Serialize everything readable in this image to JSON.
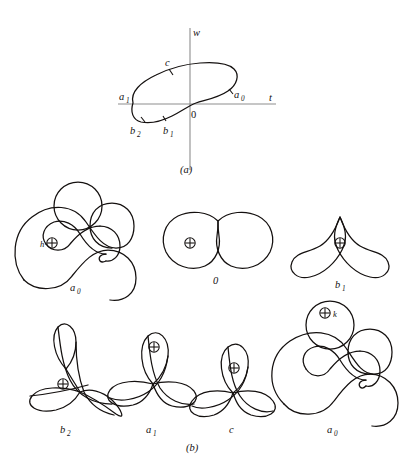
{
  "figure": {
    "background_color": "#ffffff",
    "stroke_color": "#14100f",
    "axis_color": "#8d8d8d",
    "panels": [
      {
        "id": "a",
        "caption": "(a)",
        "type": "closed-curve-in-tw-plane",
        "axes": {
          "horizontal_label": "t",
          "vertical_label": "w",
          "origin_label": "0"
        },
        "marked_points": [
          {
            "label": "a",
            "sub": "1",
            "position": "left-extreme-on-t-axis"
          },
          {
            "label": "b",
            "sub": "2",
            "position": "lower-left"
          },
          {
            "label": "b",
            "sub": "1",
            "position": "lower-middle"
          },
          {
            "label": "c",
            "sub": "",
            "position": "upper-left"
          },
          {
            "label": "a",
            "sub": "0",
            "position": "right-extreme"
          }
        ]
      },
      {
        "id": "b",
        "caption": "(b)",
        "type": "normal-forms-row",
        "figures": [
          {
            "label": "a",
            "sub": "0",
            "shape": "nested-band-with-circle",
            "index_marker": "circled-plus",
            "marker_label": "h",
            "row": 1,
            "col": 1
          },
          {
            "label": "0",
            "sub": "",
            "shape": "bilobed-cusp",
            "index_marker": "circled-plus",
            "marker_label": "",
            "row": 1,
            "col": 2
          },
          {
            "label": "b",
            "sub": "1",
            "shape": "spike-with-two-loops",
            "index_marker": "circled-plus",
            "marker_label": "",
            "row": 1,
            "col": 3
          },
          {
            "label": "b",
            "sub": "2",
            "shape": "trefoil-asymmetric",
            "index_marker": "circled-plus",
            "marker_label": "",
            "row": 2,
            "col": 1
          },
          {
            "label": "a",
            "sub": "1",
            "shape": "trefoil-upright",
            "index_marker": "circled-plus",
            "marker_label": "",
            "row": 2,
            "col": 2
          },
          {
            "label": "c",
            "sub": "",
            "shape": "trefoil-symmetric",
            "index_marker": "circled-plus",
            "marker_label": "",
            "row": 2,
            "col": 3
          },
          {
            "label": "a",
            "sub": "0",
            "shape": "nested-band-with-circle",
            "index_marker": "circled-plus",
            "marker_label": "k",
            "row": 2,
            "col": 4
          }
        ]
      }
    ]
  }
}
